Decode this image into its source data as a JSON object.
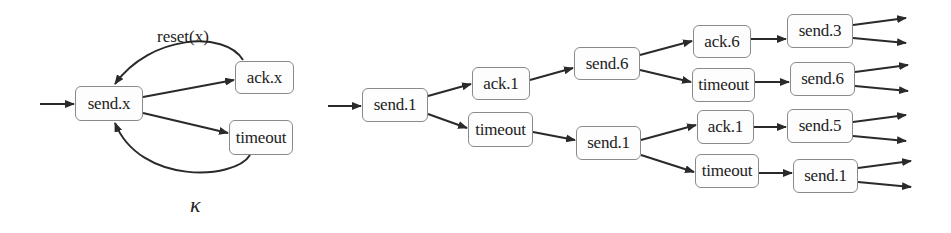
{
  "automaton": {
    "nodes": {
      "send": "send.x",
      "ack": "ack.x",
      "timeout": "timeout"
    },
    "edge_labels": {
      "reset": "reset(x)"
    },
    "caption": "κ"
  },
  "tree": {
    "level0": {
      "root": "send.1"
    },
    "level1": {
      "ack": "ack.1",
      "timeout": "timeout"
    },
    "level2": {
      "send_a": "send.6",
      "send_b": "send.1"
    },
    "level3": {
      "ack_a": "ack.6",
      "timeout_a": "timeout",
      "ack_b": "ack.1",
      "timeout_b": "timeout"
    },
    "level4": {
      "send_a": "send.3",
      "send_b": "send.6",
      "send_c": "send.5",
      "send_d": "send.1"
    }
  },
  "colors": {
    "stroke": "#2a2a2a",
    "node_border": "#8a8a8a",
    "node_fill": "#fdfdfd"
  }
}
